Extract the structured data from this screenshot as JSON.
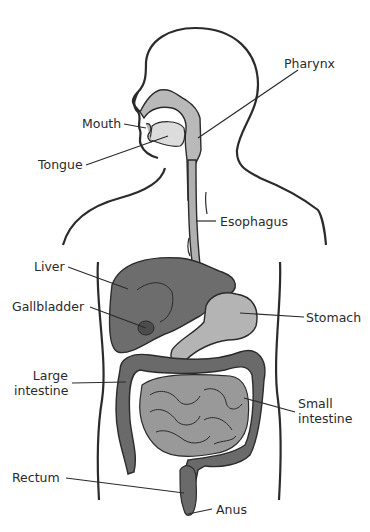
{
  "diagram": {
    "type": "anatomy",
    "colors": {
      "outline": "#2b2b2b",
      "light_gray": "#b9b9b9",
      "mid_gray": "#9a9a9a",
      "dark_gray": "#6a6a6a",
      "darker_gray": "#555555",
      "label_text": "#2a2a2a"
    },
    "labels": {
      "pharynx": "Pharynx",
      "mouth": "Mouth",
      "tongue": "Tongue",
      "esophagus": "Esophagus",
      "liver": "Liver",
      "gallbladder": "Gallbladder",
      "stomach": "Stomach",
      "large_intestine_1": "Large",
      "large_intestine_2": "intestine",
      "small_intestine_1": "Small",
      "small_intestine_2": "intestine",
      "rectum": "Rectum",
      "anus": "Anus"
    }
  }
}
